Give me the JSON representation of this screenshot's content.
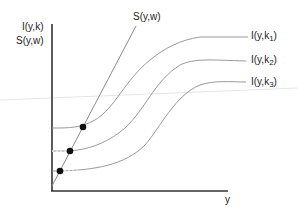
{
  "diagram": {
    "y_axis_label_line1": "I(y,k)",
    "y_axis_label_line2": "S(y,w)",
    "x_axis_label": "y",
    "saving_curve_label": "S(y,w)",
    "curves": [
      {
        "label_main": "I(y,k",
        "label_sub": "1",
        "label_close": ")"
      },
      {
        "label_main": "I(y,k",
        "label_sub": "2",
        "label_close": ")"
      },
      {
        "label_main": "I(y,k",
        "label_sub": "3",
        "label_close": ")"
      }
    ],
    "equilibrium_points": 3,
    "colors": {
      "axis": "#333333",
      "curve": "#9a9a9a",
      "point": "#111111"
    }
  }
}
